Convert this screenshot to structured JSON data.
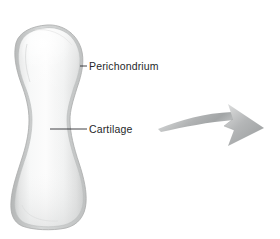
{
  "figure": {
    "background_color": "#ffffff",
    "width": 280,
    "height": 239
  },
  "labels": [
    {
      "id": "perichondrium",
      "text": "Perichondrium",
      "color": "#26282b",
      "x": 89,
      "y": 60,
      "leader_line": {
        "x1": 80,
        "y1": 66,
        "x2": 87,
        "y2": 66
      }
    },
    {
      "id": "cartilage",
      "text": "Cartilage",
      "color": "#26282b",
      "x": 89,
      "y": 123,
      "leader_line": {
        "x1": 50,
        "y1": 129,
        "x2": 87,
        "y2": 129
      }
    }
  ],
  "structures": {
    "cartilage_model": {
      "name": "Cartilage model",
      "fill_light": "#fdfdfd",
      "fill_mid": "#eceded",
      "fill_shadow": "#c9cbcb",
      "outline_color": "#b6b8b8"
    },
    "perichondrium_layer": {
      "name": "Perichondrium layer",
      "fill": "#d2d4d4",
      "outline_color": "#a9abab"
    }
  },
  "arrow": {
    "name": "process-arrow",
    "direction": "right",
    "style": "curved",
    "color_light": "#e3e4e4",
    "color_mid": "#b8babb",
    "color_dark": "#96999a",
    "start": {
      "x": 158,
      "y": 128
    },
    "tip": {
      "x": 264,
      "y": 128
    }
  }
}
